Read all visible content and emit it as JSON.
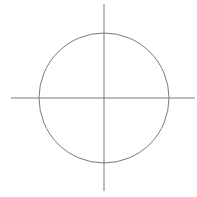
{
  "diagram": {
    "type": "circle-with-crosshair-axes",
    "background": "#ffffff",
    "stroke_color": "#7a7a7a",
    "stroke_width": 1,
    "circle": {
      "cx": 104,
      "cy": 98,
      "r": 65
    },
    "horizontal_axis": {
      "x1": 11,
      "y1": 98,
      "x2": 195,
      "y2": 98
    },
    "vertical_axis": {
      "x1": 104,
      "y1": 4,
      "x2": 104,
      "y2": 191
    }
  }
}
